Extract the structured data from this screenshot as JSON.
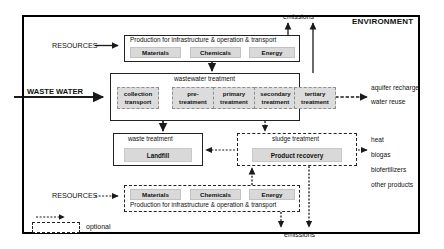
{
  "diagram": {
    "environment_label": "ENVIRONMENT",
    "legend": {
      "label": "optional"
    },
    "inputs": {
      "waste_water": "WASTE WATER",
      "resources_top": "RESOURCES",
      "resources_bottom": "RESOURCES"
    },
    "emissions_top": "emissions",
    "emissions_bottom": "emissions",
    "production_top": {
      "title": "Production for infrastructure & operation & transport",
      "chips": [
        "Materials",
        "Chemicals",
        "Energy"
      ]
    },
    "production_bottom": {
      "title": "Production for infrastructure & operation & transport",
      "chips": [
        "Materials",
        "Chemicals",
        "Energy"
      ]
    },
    "wastewater_treatment": {
      "title": "wastewater treatment",
      "stages": [
        {
          "line1": "collection",
          "line2": "transport"
        },
        {
          "line1": "pre-",
          "line2": "treatment"
        },
        {
          "line1": "primary",
          "line2": "treatment"
        },
        {
          "line1": "secondary",
          "line2": "treatment"
        },
        {
          "line1": "tertiary",
          "line2": "treatment"
        }
      ]
    },
    "waste_treatment": {
      "title": "waste treatment",
      "item": "Landfill"
    },
    "sludge_treatment": {
      "title": "sludge treatment",
      "item": "Product recovery"
    },
    "outputs": {
      "water": [
        "aquifer recharge",
        "water reuse"
      ],
      "products": [
        "heat",
        "biogas",
        "biofertilizers",
        "other products"
      ]
    },
    "colors": {
      "frame": "#000000",
      "chip_fill": "#d9d9d9",
      "stage_fill": "#dcdcdc",
      "line": "#1a1a1a"
    }
  }
}
